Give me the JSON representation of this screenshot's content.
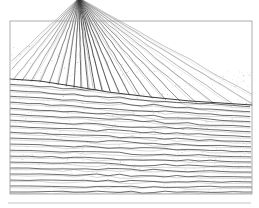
{
  "figure": {
    "title": "Ploughed field with converging furrows",
    "caption": "",
    "medium": "pen-and-ink line drawing",
    "background_color": "#ffffff",
    "ink_color": "#3a3a3a",
    "frame_color": "#9a9a9a",
    "rule_color": "#b5b5b5",
    "canvas": {
      "width": 259,
      "height": 208
    }
  },
  "frame": {
    "name": "image-border",
    "x": 10,
    "y": 21,
    "width": 242,
    "height": 173,
    "stroke_width": 0.8
  },
  "bottom_rule": {
    "name": "horizontal-separator",
    "x1": 8,
    "y1": 203,
    "x2": 251,
    "y2": 203,
    "stroke_width": 0.8
  },
  "vanishing_point": {
    "x": 79,
    "y": -2
  },
  "ridge_line": {
    "name": "horizon-ridge",
    "points": "10,79 40,81 72,86 108,92 150,97 190,101 252,105",
    "stroke_width": 1.0
  },
  "fan_furrows": {
    "count": 26,
    "description": "Furrow lines radiating from the vanishing point near the top edge down across the upper field",
    "end_x": [
      -34,
      -18,
      -2,
      12,
      24,
      36,
      47,
      57,
      66,
      74,
      81,
      88,
      95,
      102,
      110,
      119,
      129,
      140,
      152,
      166,
      181,
      198,
      216,
      236,
      258,
      276
    ],
    "end_y": [
      104,
      101,
      98,
      95,
      93,
      91,
      90,
      89,
      88,
      88,
      88,
      88,
      89,
      90,
      91,
      92,
      94,
      96,
      98,
      100,
      102,
      104,
      105,
      106,
      107,
      108
    ]
  },
  "field_furrows": {
    "count": 24,
    "description": "Near-parallel furrow lines across the lower field, rising slightly to the right",
    "left_y": [
      84,
      90,
      96,
      102,
      108,
      114,
      120,
      126,
      132,
      138,
      144,
      150,
      156,
      162,
      168,
      174,
      180,
      186,
      192,
      197,
      202,
      207,
      212,
      217
    ],
    "right_y": [
      102,
      107,
      112,
      117,
      122,
      127,
      132,
      137,
      142,
      147,
      152,
      157,
      162,
      167,
      172,
      177,
      182,
      187,
      192,
      196,
      200,
      204,
      208,
      212
    ],
    "stroke_width": 0.85
  },
  "stipple": {
    "description": "Light speckled texture between furrow rows suggesting clods of earth",
    "density": 420,
    "color": "#8d8d8d"
  }
}
